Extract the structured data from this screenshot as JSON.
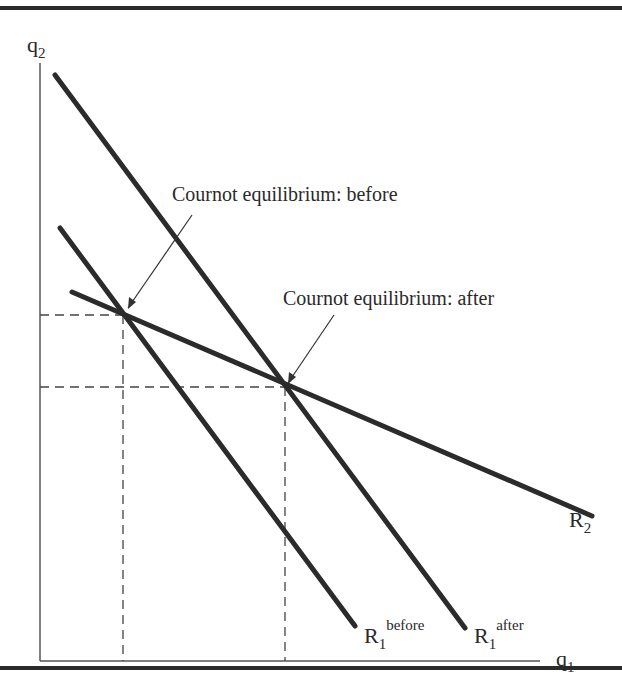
{
  "diagram": {
    "axes": {
      "y_label": "q",
      "y_sub": "2",
      "x_label": "q",
      "x_sub": "1"
    },
    "curves": [
      {
        "id": "R1_before",
        "label": "R",
        "sub": "1",
        "sup": "before"
      },
      {
        "id": "R1_after",
        "label": "R",
        "sub": "1",
        "sup": "after"
      },
      {
        "id": "R2",
        "label": "R",
        "sub": "2",
        "sup": ""
      }
    ],
    "annotations": {
      "before": "Cournot equilibrium: before",
      "after": "Cournot equilibrium: after"
    },
    "colors": {
      "line": "#2b2b2b",
      "axis": "#555555",
      "text": "#2a2a2a"
    }
  }
}
